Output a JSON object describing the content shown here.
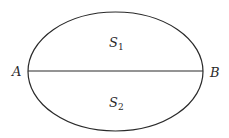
{
  "diagram": {
    "type": "ellipse-with-chord",
    "ellipse": {
      "cx": 115.5,
      "cy": 71.5,
      "rx": 87.5,
      "ry": 59.5,
      "stroke": "#2a2a2a",
      "fill": "#ffffff"
    },
    "chord": {
      "x1": 28,
      "y1": 71,
      "x2": 203,
      "y2": 71,
      "stroke": "#2a2a2a"
    },
    "labels": {
      "point_a": "A",
      "point_b": "B",
      "region_top": {
        "base": "S",
        "sub": "1"
      },
      "region_bottom": {
        "base": "S",
        "sub": "2"
      }
    }
  }
}
